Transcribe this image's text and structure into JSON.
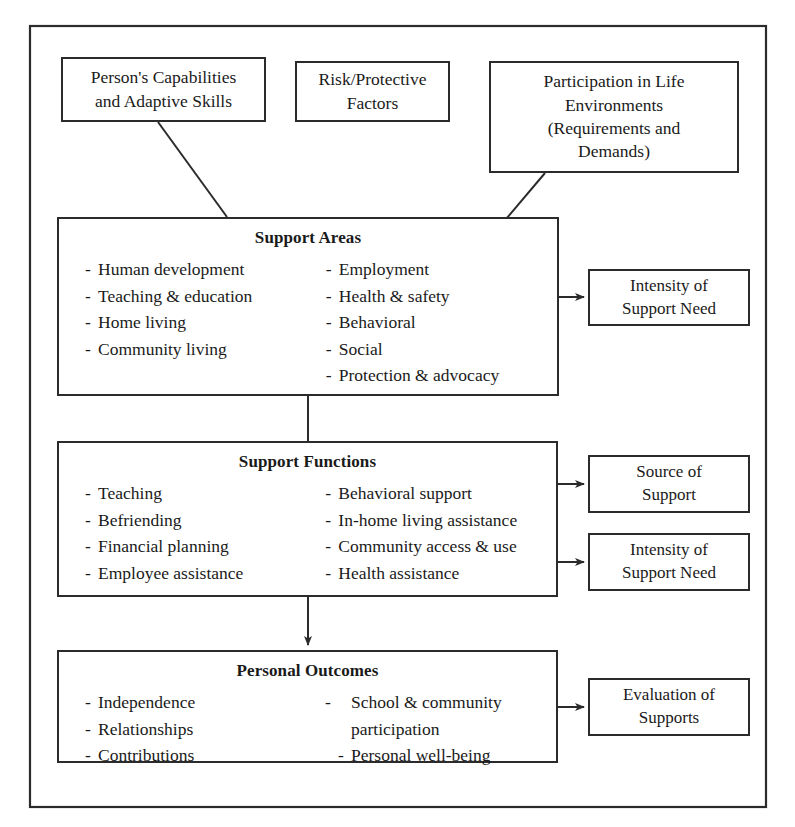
{
  "diagram": {
    "line_color": "#2b2b2b",
    "background": "#ffffff"
  },
  "top_boxes": [
    {
      "id": "persons-capabilities",
      "lines": [
        "Person's Capabilities",
        "and Adaptive Skills"
      ]
    },
    {
      "id": "risk-protective-factors",
      "lines": [
        "Risk/Protective",
        "Factors"
      ]
    },
    {
      "id": "participation-life-environments",
      "lines": [
        "Participation in Life",
        "Environments",
        "(Requirements and",
        "Demands)"
      ]
    }
  ],
  "main_boxes": [
    {
      "id": "support-areas",
      "heading": "Support Areas",
      "left_items": [
        "Human development",
        "Teaching & education",
        "Home living",
        "Community living"
      ],
      "right_items": [
        "Employment",
        "Health & safety",
        "Behavioral",
        "Social",
        "Protection & advocacy"
      ]
    },
    {
      "id": "support-functions",
      "heading": "Support Functions",
      "left_items": [
        "Teaching",
        "Befriending",
        "Financial planning",
        "Employee assistance"
      ],
      "right_items": [
        "Behavioral support",
        "In-home living assistance",
        "Community access & use",
        "Health assistance"
      ]
    },
    {
      "id": "personal-outcomes",
      "heading": "Personal Outcomes",
      "left_items": [
        "Independence",
        "Relationships",
        "Contributions"
      ],
      "right_items": [
        "School & community participation",
        "Personal well-being"
      ]
    }
  ],
  "side_boxes": [
    {
      "id": "intensity-of-support-need-areas",
      "lines": [
        "Intensity of",
        "Support Need"
      ]
    },
    {
      "id": "source-of-support",
      "lines": [
        "Source of",
        "Support"
      ]
    },
    {
      "id": "intensity-of-support-need-functions",
      "lines": [
        "Intensity of",
        "Support Need"
      ]
    },
    {
      "id": "evaluation-of-supports",
      "lines": [
        "Evaluation of",
        "Supports"
      ]
    }
  ]
}
